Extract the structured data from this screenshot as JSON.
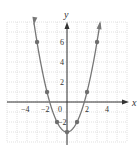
{
  "chart_data": {
    "type": "line",
    "title": "",
    "xlabel": "x",
    "ylabel": "y",
    "equation_implied": "y = x^2 - 3",
    "xlim": [
      -6,
      6
    ],
    "ylim": [
      -4,
      8
    ],
    "grid": true,
    "x_tick_labels": [
      "-4",
      "-2",
      "0",
      "2",
      "4"
    ],
    "y_tick_labels": [
      "-2",
      "2",
      "4",
      "6"
    ],
    "series": [
      {
        "name": "parabola",
        "points": [
          [
            -3,
            6
          ],
          [
            -2,
            1
          ],
          [
            -1,
            -2
          ],
          [
            0,
            -3
          ],
          [
            1,
            -2
          ],
          [
            2,
            1
          ],
          [
            3,
            6
          ]
        ]
      }
    ],
    "colors": {
      "curve": "#777777",
      "points": "#6e6e6e",
      "axis": "#333333",
      "grid": "#cfcfcf"
    }
  },
  "labels": {
    "x_axis": "x",
    "y_axis": "y",
    "x_ticks": [
      {
        "text": "−4",
        "value": -4
      },
      {
        "text": "−2",
        "value": -2
      },
      {
        "text": "2",
        "value": 2
      },
      {
        "text": "4",
        "value": 4
      }
    ],
    "y_ticks": [
      {
        "text": "6",
        "value": 6
      },
      {
        "text": "4",
        "value": 4
      },
      {
        "text": "2",
        "value": 2
      },
      {
        "text": "−2",
        "value": -2
      }
    ],
    "origin": "0"
  }
}
